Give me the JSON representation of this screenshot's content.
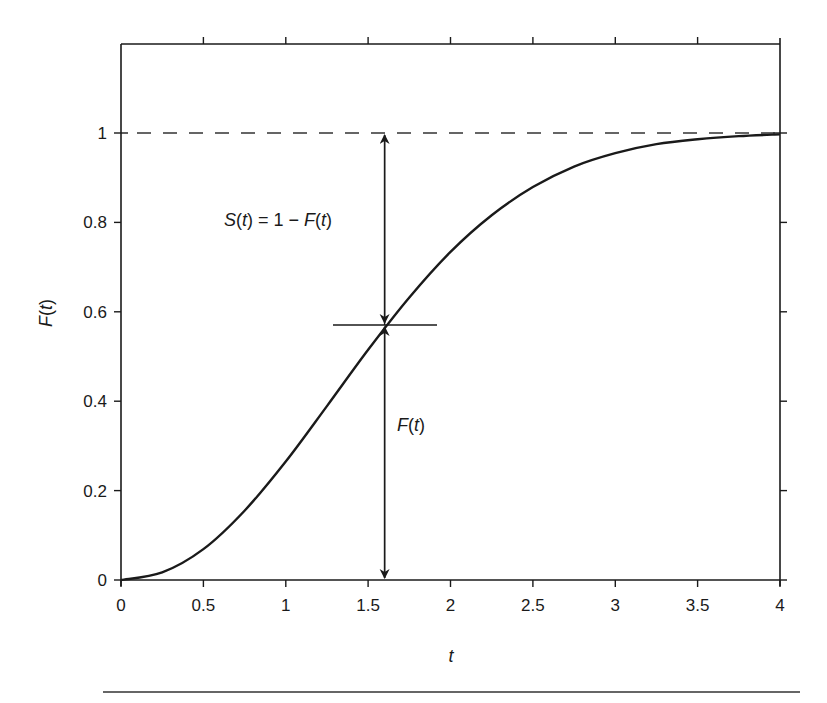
{
  "chart_data": {
    "type": "line",
    "title": "",
    "xlabel": "t",
    "ylabel": "F(t)",
    "xlim": [
      0,
      4
    ],
    "ylim": [
      0,
      1.2
    ],
    "x_ticks": [
      "0",
      "0.5",
      "1",
      "1.5",
      "2",
      "2.5",
      "3",
      "3.5",
      "4"
    ],
    "y_ticks": [
      "0",
      "0.2",
      "0.4",
      "0.6",
      "0.8",
      "1"
    ],
    "grid": false,
    "legend": null,
    "series": [
      {
        "name": "F(t)",
        "style": "solid",
        "x": [
          0,
          0.25,
          0.5,
          0.75,
          1.0,
          1.25,
          1.5,
          1.75,
          2.0,
          2.25,
          2.5,
          2.75,
          3.0,
          3.25,
          3.5,
          3.75,
          4.0
        ],
        "values": [
          0,
          0.017,
          0.069,
          0.155,
          0.265,
          0.389,
          0.515,
          0.632,
          0.734,
          0.816,
          0.879,
          0.925,
          0.955,
          0.975,
          0.986,
          0.993,
          0.997
        ]
      },
      {
        "name": "asymptote",
        "style": "dashed",
        "x": [
          0,
          4
        ],
        "values": [
          1,
          1
        ]
      }
    ],
    "annotations": [
      {
        "text": "S(t) = 1 − F(t)",
        "type": "double-arrow",
        "x": 1.6,
        "from": 0.57,
        "to": 1.0
      },
      {
        "text": "F(t)",
        "type": "double-arrow",
        "x": 1.6,
        "from": 0.0,
        "to": 0.57
      },
      {
        "type": "marker-line",
        "x_from": 1.28,
        "x_to": 1.92,
        "y": 0.57
      }
    ]
  },
  "labels": {
    "xlabel": "t",
    "ylabel_main": "F",
    "ylabel_arg": "(t)",
    "s_annot": {
      "s": "S",
      "open": "(",
      "t1": "t",
      "mid": ") = 1 − ",
      "f": "F",
      "open2": "(",
      "t2": "t",
      "close": ")"
    },
    "f_annot": {
      "f": "F",
      "open": "(",
      "t": "t",
      "close": ")"
    },
    "x_ticks": [
      "0",
      "0.5",
      "1",
      "1.5",
      "2",
      "2.5",
      "3",
      "3.5",
      "4"
    ],
    "y_ticks": [
      "0",
      "0.2",
      "0.4",
      "0.6",
      "0.8",
      "1"
    ]
  }
}
